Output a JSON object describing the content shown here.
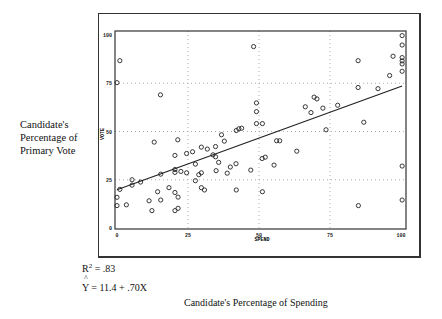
{
  "chart_data": {
    "type": "scatter",
    "title": "",
    "xlabel": "SPEND",
    "ylabel": "VOTE",
    "outer_xlabel": "Candidate's Percentage of Spending",
    "outer_ylabel": "Candidate's Percentage of Primary Vote",
    "xlim": [
      0,
      100
    ],
    "ylim": [
      0,
      100
    ],
    "xticks": [
      "0",
      "25",
      "50",
      "75",
      "100"
    ],
    "yticks": [
      "0",
      "25",
      "50",
      "75",
      "100"
    ],
    "grid": "dotted at 25, 50, 75",
    "marker": "open circle",
    "points": [
      [
        0,
        75.3
      ],
      [
        1,
        86.7
      ],
      [
        0,
        15.9
      ],
      [
        0,
        11.6
      ],
      [
        3.3,
        12
      ],
      [
        1,
        20
      ],
      [
        5.3,
        25
      ],
      [
        5.3,
        22.2
      ],
      [
        8.3,
        23.8
      ],
      [
        11.3,
        14.1
      ],
      [
        12.3,
        9
      ],
      [
        13.1,
        44.5
      ],
      [
        14.3,
        18.8
      ],
      [
        15.3,
        69
      ],
      [
        15.4,
        14.5
      ],
      [
        15.4,
        27.9
      ],
      [
        18.3,
        20.9
      ],
      [
        20.4,
        37.6
      ],
      [
        20.4,
        18.4
      ],
      [
        20.4,
        9
      ],
      [
        20.4,
        28.8
      ],
      [
        20.4,
        30.3
      ],
      [
        21.4,
        45.7
      ],
      [
        21.5,
        16
      ],
      [
        21.5,
        10.2
      ],
      [
        22.5,
        29.3
      ],
      [
        24.5,
        38.6
      ],
      [
        24.5,
        28.6
      ],
      [
        26.6,
        39.5
      ],
      [
        27.6,
        33.1
      ],
      [
        27.6,
        24.5
      ],
      [
        28.8,
        27.6
      ],
      [
        29.7,
        41.9
      ],
      [
        29.7,
        28.6
      ],
      [
        29.7,
        20.9
      ],
      [
        30.8,
        19.7
      ],
      [
        31.8,
        40.9
      ],
      [
        33.8,
        37.9
      ],
      [
        34.7,
        42.2
      ],
      [
        34.7,
        36.9
      ],
      [
        34.9,
        29.7
      ],
      [
        35.8,
        34
      ],
      [
        36.8,
        48.3
      ],
      [
        37.8,
        45
      ],
      [
        38.8,
        28.4
      ],
      [
        39.9,
        31.6
      ],
      [
        41.9,
        33.3
      ],
      [
        42,
        19.7
      ],
      [
        42,
        50.5
      ],
      [
        42.9,
        51.4
      ],
      [
        43.9,
        51.7
      ],
      [
        47.1,
        30
      ],
      [
        48.1,
        94
      ],
      [
        49.1,
        64.8
      ],
      [
        49.1,
        60.3
      ],
      [
        49.1,
        54.1
      ],
      [
        51.1,
        36
      ],
      [
        51.2,
        54.1
      ],
      [
        51.2,
        18.8
      ],
      [
        52.2,
        36.7
      ],
      [
        55.3,
        32.6
      ],
      [
        56.2,
        45.2
      ],
      [
        57.3,
        45.2
      ],
      [
        63.3,
        39.8
      ],
      [
        66.3,
        62.8
      ],
      [
        68.3,
        59.8
      ],
      [
        69.4,
        67.8
      ],
      [
        70.4,
        66.9
      ],
      [
        72.5,
        62.1
      ],
      [
        73.6,
        50.9
      ],
      [
        77.7,
        63.6
      ],
      [
        84.9,
        86.7
      ],
      [
        84.9,
        72.8
      ],
      [
        85,
        11.6
      ],
      [
        86.9,
        54.8
      ],
      [
        91.9,
        72.2
      ],
      [
        96,
        79
      ],
      [
        97.2,
        89
      ],
      [
        100.4,
        99.7
      ],
      [
        100.4,
        94.8
      ],
      [
        100.4,
        88.3
      ],
      [
        100.4,
        86.6
      ],
      [
        100.4,
        85
      ],
      [
        100.4,
        81.2
      ],
      [
        100.4,
        32.1
      ],
      [
        100.4,
        14.5
      ]
    ],
    "regression_line": {
      "x": [
        0,
        100.4
      ],
      "y": [
        19.8,
        73.6
      ]
    },
    "annotations": [
      "R² = .83",
      "Ŷ = 11.4 + .70X"
    ]
  },
  "labels": {
    "side_label": "Candidate's Percentage of Primary Vote",
    "r2_prefix": "R",
    "r2_exp": "2",
    "r2_value": " = .83",
    "eq_hat": "^",
    "eq_text": "Y = 11.4  + .70X",
    "x_caption": "Candidate's Percentage of Spending"
  }
}
